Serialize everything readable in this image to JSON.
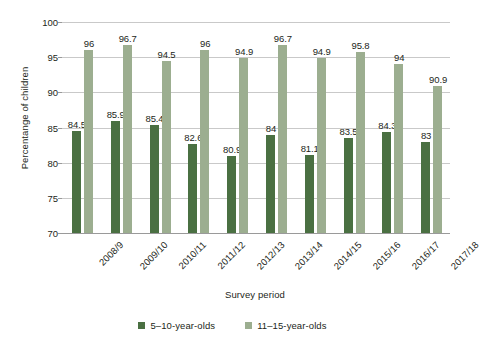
{
  "chart_data": {
    "type": "bar",
    "title": "",
    "xlabel": "Survey period",
    "ylabel": "Percentange of children",
    "ylim": [
      70,
      100
    ],
    "yticks": [
      70,
      75,
      80,
      85,
      90,
      95,
      100
    ],
    "grid": true,
    "legend_position": "bottom",
    "categories": [
      "2008/9",
      "2009/10",
      "2010/11",
      "2011/12",
      "2012/13",
      "2013/14",
      "2014/15",
      "2015/16",
      "2016/17",
      "2017/18"
    ],
    "series": [
      {
        "name": "5–10-year-olds",
        "color": "#4a7042",
        "values": [
          84.5,
          85.9,
          85.4,
          82.6,
          80.9,
          84,
          81.1,
          83.5,
          84.3,
          83
        ],
        "labels": [
          "84.5",
          "85.9",
          "85.4",
          "82.6",
          "80.9",
          "84",
          "81.1",
          "83.5",
          "84.3",
          "83"
        ]
      },
      {
        "name": "11–15-year-olds",
        "color": "#9cae90",
        "values": [
          96,
          96.7,
          94.5,
          96,
          94.9,
          96.7,
          94.9,
          95.8,
          94,
          90.9
        ],
        "labels": [
          "96",
          "96.7",
          "94.5",
          "96",
          "94.9",
          "96.7",
          "94.9",
          "95.8",
          "94",
          "90.9"
        ]
      }
    ]
  },
  "axes": {
    "y_title": "Percentange of children",
    "x_title": "Survey period",
    "y_tick_labels": [
      "100",
      "95",
      "90",
      "85",
      "80",
      "75",
      "70"
    ]
  },
  "legend": {
    "items": [
      {
        "label": "5–10-year-olds",
        "color": "#4a7042"
      },
      {
        "label": "11–15-year-olds",
        "color": "#9cae90"
      }
    ]
  },
  "colors": {
    "series_young": "#4a7042",
    "series_old": "#9cae90",
    "gridline": "#c9c9c9",
    "axis": "#9a9a9a",
    "text": "#231f20",
    "background": "#ffffff"
  }
}
